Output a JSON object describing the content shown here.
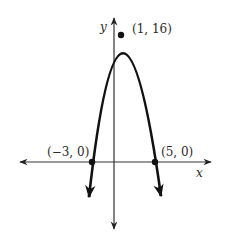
{
  "diagram": {
    "type": "parabola-graph",
    "axes": {
      "x_label": "x",
      "y_label": "y"
    },
    "points": [
      {
        "label": "(1, 16)",
        "role": "vertex",
        "x": 1,
        "y": 16
      },
      {
        "label": "(−3, 0)",
        "role": "x-intercept",
        "x": -3,
        "y": 0
      },
      {
        "label": "(5, 0)",
        "role": "x-intercept",
        "x": 5,
        "y": 0
      }
    ],
    "colors": {
      "curve": "#1a1a1a",
      "axes": "#333333",
      "text": "#2a2a2a"
    }
  }
}
